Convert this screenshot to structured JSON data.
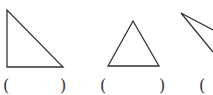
{
  "figures": [
    {
      "name": "right-triangle",
      "points": "7,10 7,67 63,67"
    },
    {
      "name": "equilateral-triangle",
      "points": "133,21 108,66 159,66"
    },
    {
      "name": "obtuse-triangle-partial",
      "points": "181,13 213,30 213,52"
    }
  ],
  "answers": [
    {
      "open": "(",
      "close": ")"
    },
    {
      "open": "(",
      "close": ")"
    },
    {
      "open": "(",
      "close": ""
    }
  ],
  "colors": {
    "stroke": "#333333",
    "background": "#ffffff"
  }
}
